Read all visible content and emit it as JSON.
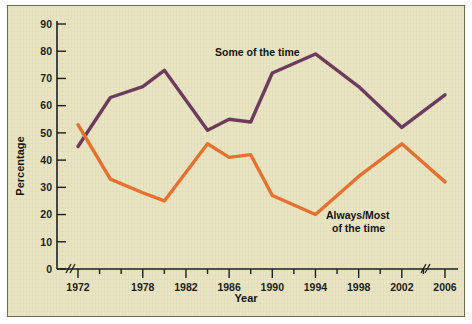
{
  "chart_data": {
    "type": "line",
    "title": "",
    "xlabel": "Year",
    "ylabel": "Percentage",
    "x": [
      1972,
      1975,
      1978,
      1980,
      1984,
      1986,
      1988,
      1990,
      1994,
      1998,
      2002,
      2006
    ],
    "xlim": [
      1972,
      2006
    ],
    "ylim": [
      0,
      90
    ],
    "ytick_step": 10,
    "yticks": [
      "0",
      "10",
      "20",
      "30",
      "40",
      "50",
      "60",
      "70",
      "80",
      "90"
    ],
    "xticks": [
      "1972",
      "1978",
      "1982",
      "1986",
      "1990",
      "1994",
      "1998",
      "2002",
      "2006"
    ],
    "x_axis_break": true,
    "x_axis_break_note": "break after 1972 and before 2006",
    "grid": false,
    "legend_position": "inline-annotations",
    "series": [
      {
        "name": "Some of the time",
        "color": "#6d3a5d",
        "values": [
          45,
          63,
          67,
          73,
          51,
          55,
          54,
          72,
          79,
          67,
          52,
          64
        ]
      },
      {
        "name": "Always/Most of the time",
        "color": "#e8712f",
        "values": [
          53,
          33,
          28,
          25,
          46,
          41,
          42,
          27,
          20,
          34,
          46,
          32
        ]
      }
    ],
    "annotations": [
      {
        "text": "Some of the time",
        "x": 1986,
        "y": 84
      },
      {
        "text": "Always/Most",
        "x": 1996,
        "y": 22
      },
      {
        "text": "of the time",
        "x": 1996,
        "y": 17
      }
    ]
  },
  "labels": {
    "series_some": "Some of the time",
    "series_always_line1": "Always/Most",
    "series_always_line2": "of the time",
    "y_axis_title": "Percentage",
    "x_axis_title": "Year"
  },
  "colors": {
    "background": "#e9e5c3",
    "purple": "#6d3a5d",
    "orange": "#e8712f",
    "axis": "#1c1c1c",
    "frame": "#6e6a50"
  }
}
